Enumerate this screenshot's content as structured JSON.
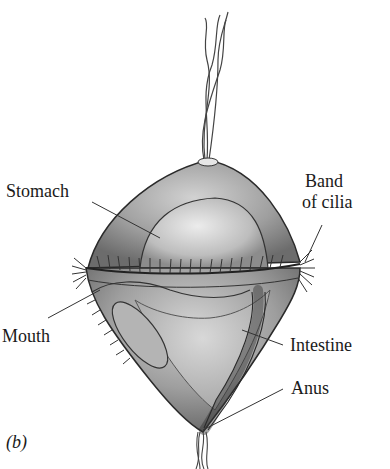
{
  "figure": {
    "panel_label": "(b)",
    "labels": {
      "stomach": "Stomach",
      "band_of_cilia_line1": "Band",
      "band_of_cilia_line2": "of cilia",
      "mouth": "Mouth",
      "intestine": "Intestine",
      "anus": "Anus"
    },
    "colors": {
      "body_fill": "#9a9a9a",
      "stomach_fill": "#c8c8c8",
      "outline": "#2a2a2a",
      "text": "#1a1a1a"
    }
  }
}
